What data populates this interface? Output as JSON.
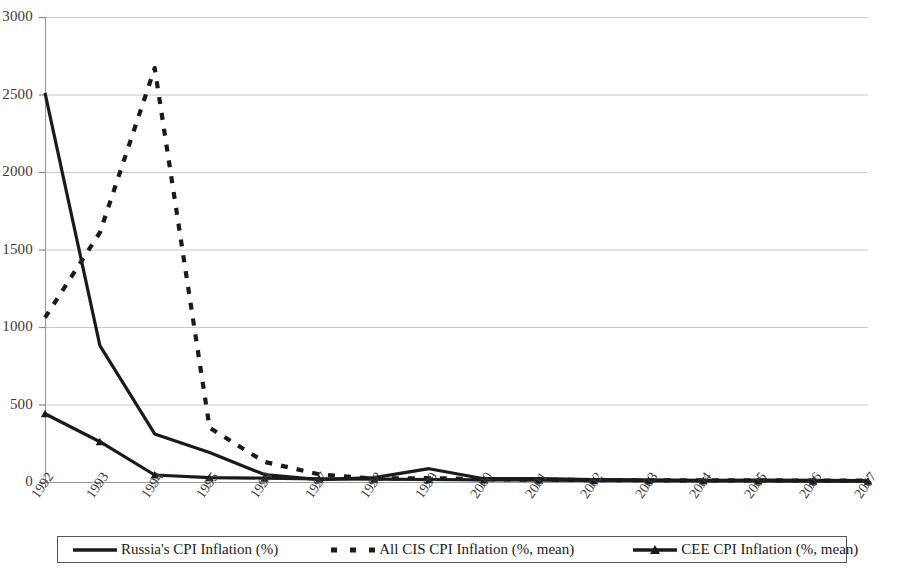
{
  "chart_data": {
    "type": "line",
    "title": "",
    "subtitle": "",
    "xlabel": "",
    "ylabel": "",
    "ylim": [
      0,
      3000
    ],
    "ytick_values": [
      0,
      500,
      1000,
      1500,
      2000,
      2500,
      3000
    ],
    "ytick_labels": [
      "0",
      "500",
      "1000",
      "1500",
      "2000",
      "2500",
      "3000"
    ],
    "grid": true,
    "grid_axis": "y",
    "legend_position": "bottom",
    "categories": [
      "1992",
      "1993",
      "1994",
      "1995",
      "1996",
      "1997",
      "1998",
      "1999",
      "2000",
      "2001",
      "2002",
      "2003",
      "2004",
      "2005",
      "2006",
      "2007"
    ],
    "series": [
      {
        "name": "Russia's CPI Inflation (%)",
        "style": "solid",
        "color": "#1a1a1a",
        "marker": "none",
        "values": [
          2510,
          880,
          310,
          190,
          48,
          15,
          28,
          86,
          21,
          22,
          16,
          14,
          11,
          13,
          10,
          9
        ]
      },
      {
        "name": "All CIS CPI Inflation (%, mean)",
        "style": "dashed",
        "color": "#1a1a1a",
        "marker": "none",
        "values": [
          1060,
          1610,
          2670,
          350,
          130,
          50,
          22,
          25,
          18,
          15,
          12,
          11,
          10,
          11,
          9,
          9
        ]
      },
      {
        "name": "CEE CPI Inflation (%, mean)",
        "style": "solid",
        "color": "#1a1a1a",
        "marker": "triangle",
        "values": [
          440,
          260,
          45,
          28,
          25,
          20,
          18,
          16,
          14,
          12,
          10,
          9,
          8,
          7,
          6,
          6
        ]
      }
    ]
  },
  "axes": {
    "y_labels": [
      "3000",
      "2500",
      "2000",
      "1500",
      "1000",
      "500",
      "0"
    ],
    "x_labels": [
      "1992",
      "1993",
      "1994",
      "1995",
      "1996",
      "1997",
      "1998",
      "1999",
      "2000",
      "2001",
      "2002",
      "2003",
      "2004",
      "2005",
      "2006",
      "2007"
    ]
  },
  "legend": {
    "items": [
      {
        "label": "Russia's CPI Inflation (%)",
        "swatch": "solid-line-swatch"
      },
      {
        "label": "All CIS CPI Inflation (%, mean)",
        "swatch": "dashed-line-swatch"
      },
      {
        "label": "CEE CPI Inflation (%, mean)",
        "swatch": "solid-line-marker-swatch"
      }
    ]
  }
}
